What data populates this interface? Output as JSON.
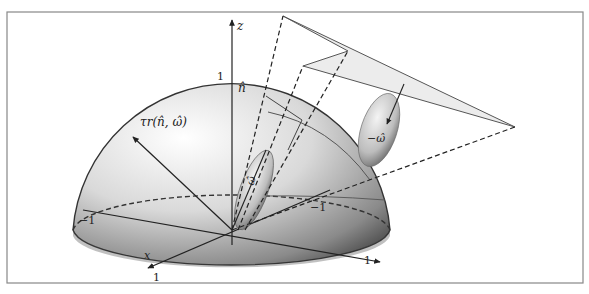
{
  "figure": {
    "axes": {
      "z_label": "z",
      "x_label": "x",
      "z_tick": "1",
      "x_tick": "1",
      "y_tick": "1",
      "neg_x_tick": "−1",
      "neg_y_tick": "−1"
    },
    "vectors": {
      "normal_label": "n̂",
      "tangent_label": "τr(n̂, ω̂)",
      "omega_label": "ω̂",
      "neg_omega_label": "−ω̂"
    },
    "colors": {
      "frame": "#888888",
      "line": "#333333",
      "plane_fill": "#ececec",
      "sphere_light": "#ffffff",
      "sphere_dark": "#3a3a3a"
    }
  }
}
